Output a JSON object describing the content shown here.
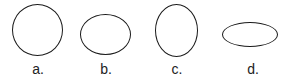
{
  "figure": {
    "items": [
      {
        "label": "a.",
        "shape": "circle",
        "width": 51,
        "height": 52
      },
      {
        "label": "b.",
        "shape": "ellipse-wide",
        "width": 51,
        "height": 41
      },
      {
        "label": "c.",
        "shape": "ellipse-tall",
        "width": 43,
        "height": 53
      },
      {
        "label": "d.",
        "shape": "ellipse-flat",
        "width": 56,
        "height": 25
      }
    ],
    "stroke_color": "#1a1a1a",
    "background": "#ffffff"
  }
}
